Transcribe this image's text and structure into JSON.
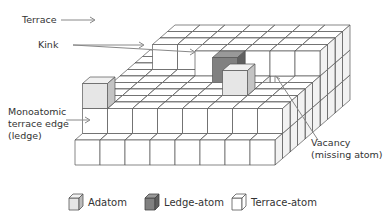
{
  "labels": {
    "terrace": "Terrace",
    "kink": "Kink",
    "ledge_line1": "Monoatomic",
    "ledge_line2": "terrace edge",
    "ledge_line3": "(ledge)",
    "vacancy_line1": "Vacancy",
    "vacancy_line2": "(missing atom)"
  },
  "legend": [
    {
      "label": "Adatom",
      "fill": "#e6e6e6"
    },
    {
      "label": "Ledge-atom",
      "fill": "#808080"
    },
    {
      "label": "Terrace-atom",
      "fill": "#ffffff"
    }
  ],
  "colors": {
    "line": "#555555",
    "arrow": "#888888",
    "adatom": "#e6e6e6",
    "ledge_atom": "#808080",
    "terrace_atom": "#ffffff"
  }
}
